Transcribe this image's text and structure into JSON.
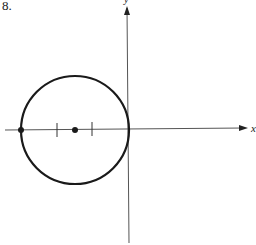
{
  "figure": {
    "number_label": "8.",
    "x_axis_label": "x",
    "y_axis_label": "y",
    "colors": {
      "ink": "#1a1a1a",
      "axis": "#555555",
      "background": "#ffffff"
    }
  },
  "geometry": {
    "origin": [
      127,
      130
    ],
    "circle": {
      "cx": 75,
      "cy": 130,
      "r": 54
    },
    "points": [
      {
        "name": "leftmost-point",
        "x": 21,
        "y": 130
      },
      {
        "name": "center-point",
        "x": 75,
        "y": 130
      }
    ],
    "ticks": [
      57,
      92
    ]
  }
}
